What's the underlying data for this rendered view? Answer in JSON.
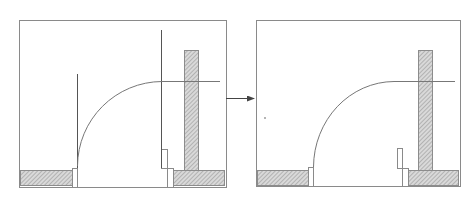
{
  "diagram": {
    "title": "",
    "colors": {
      "background": "#ffffff",
      "frame": "#8a8a8a",
      "line": "#555555",
      "arc": "#777777",
      "hatch_fill": "#d9d9d9",
      "hatch_line": "#8c8c8c",
      "arrow": "#444444"
    },
    "panels": [
      {
        "id": "before",
        "frame": {
          "x": 19,
          "y": 20,
          "w": 207,
          "h": 167
        },
        "left_wall": {
          "x": 20,
          "y": 170,
          "w": 52,
          "h": 15
        },
        "left_jamb": {
          "x": 72,
          "y": 168,
          "w": 5,
          "h": 19
        },
        "door_leaf_line": {
          "x": 77,
          "y1": 74,
          "y2": 168
        },
        "swing_arc": {
          "x1": 77,
          "y1": 166,
          "x2": 162,
          "y2": 81
        },
        "horizontal_line": {
          "x1": 162,
          "x2": 220,
          "y": 81
        },
        "stop_line": {
          "x": 161,
          "y1": 30,
          "y2": 168
        },
        "right_stop_upper": {
          "x": 161,
          "y": 149,
          "w": 6,
          "h": 19
        },
        "right_jamb": {
          "x": 167,
          "y": 168,
          "w": 6,
          "h": 19
        },
        "right_wall_column": {
          "x": 184,
          "y": 50,
          "w": 14,
          "h": 120
        },
        "right_wall_base": {
          "x": 173,
          "y": 170,
          "w": 51,
          "h": 15
        }
      },
      {
        "id": "after",
        "frame": {
          "x": 256,
          "y": 20,
          "w": 204,
          "h": 166
        },
        "left_wall": {
          "x": 257,
          "y": 170,
          "w": 51,
          "h": 15
        },
        "left_jamb": {
          "x": 308,
          "y": 167,
          "w": 5,
          "h": 19
        },
        "swing_arc": {
          "x1": 313,
          "y1": 167,
          "x2": 394,
          "y2": 81
        },
        "horizontal_line": {
          "x1": 394,
          "x2": 455,
          "y": 81
        },
        "right_stop_upper": {
          "x": 397,
          "y": 148,
          "w": 5,
          "h": 20
        },
        "right_jamb": {
          "x": 402,
          "y": 168,
          "w": 6,
          "h": 18
        },
        "right_wall_column": {
          "x": 418,
          "y": 50,
          "w": 14,
          "h": 120
        },
        "right_wall_base": {
          "x": 408,
          "y": 170,
          "w": 50,
          "h": 15
        },
        "dot": {
          "x": 265,
          "y": 118
        }
      }
    ],
    "arrow": {
      "x1": 226,
      "y1": 98,
      "x2": 254,
      "y2": 98,
      "label": "transforms-to"
    }
  }
}
